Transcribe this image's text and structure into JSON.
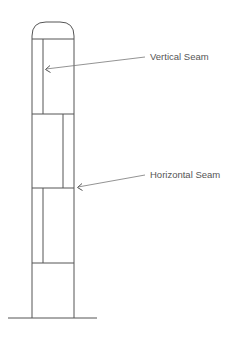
{
  "diagram": {
    "labels": [
      {
        "id": "vertical-seam",
        "text": "Vertical Seam",
        "x": 150,
        "y": 60
      },
      {
        "id": "horizontal-seam",
        "text": "Horizontal Seam",
        "x": 150,
        "y": 178
      }
    ],
    "colors": {
      "line": "#555555",
      "leader": "#777777",
      "text": "#555555",
      "background": "#ffffff"
    }
  }
}
